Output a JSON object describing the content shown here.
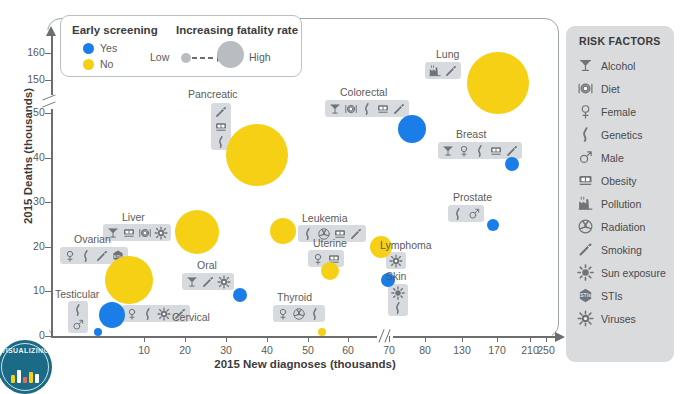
{
  "chart_data": {
    "type": "scatter",
    "title": "",
    "xlabel": "2015 New diagnoses (thousands)",
    "ylabel": "2015 Deaths (thousands)",
    "xticks": [
      10,
      20,
      30,
      40,
      50,
      60,
      70,
      80,
      130,
      170,
      210,
      250
    ],
    "yticks": [
      0,
      10,
      20,
      30,
      40,
      50,
      150,
      160
    ],
    "x_axis_break_after": 80,
    "y_axis_break_after": 50,
    "grid": false,
    "bubble_meaning": "bubble size = fatality rate (deaths / new diagnoses)",
    "color_meaning": "color = early screening available (blue = Yes, yellow = No)",
    "points": [
      {
        "label": "Lung",
        "x": 224,
        "y": 158,
        "early_screening": "Yes",
        "fatality": "High",
        "risk_factors": [
          "Pollution",
          "Smoking"
        ]
      },
      {
        "label": "Colorectal",
        "x": 134,
        "y": 49,
        "early_screening": "Yes",
        "fatality": "Medium",
        "risk_factors": [
          "Alcohol",
          "Diet",
          "Genetics",
          "Obesity",
          "Smoking"
        ]
      },
      {
        "label": "Breast",
        "x": 232,
        "y": 41,
        "early_screening": "Yes",
        "fatality": "Low",
        "risk_factors": [
          "Alcohol",
          "Female",
          "Genetics",
          "Obesity",
          "Smoking"
        ]
      },
      {
        "label": "Pancreatic",
        "x": 49,
        "y": 41,
        "early_screening": "No",
        "fatality": "High",
        "risk_factors": [
          "Smoking",
          "Obesity",
          "Genetics"
        ]
      },
      {
        "label": "Liver",
        "x": 36,
        "y": 26,
        "early_screening": "No",
        "fatality": "High",
        "risk_factors": [
          "Alcohol",
          "Obesity",
          "Diet",
          "Viruses"
        ]
      },
      {
        "label": "Leukemia",
        "x": 54,
        "y": 24,
        "early_screening": "No",
        "fatality": "Medium",
        "risk_factors": [
          "Genetics",
          "Radiation",
          "Obesity",
          "Smoking"
        ]
      },
      {
        "label": "Ovarian",
        "x": 22,
        "y": 14,
        "early_screening": "No",
        "fatality": "High",
        "risk_factors": [
          "Female",
          "Genetics",
          "Smoking",
          "STIs"
        ]
      },
      {
        "label": "Lymphoma",
        "x": 72,
        "y": 20,
        "early_screening": "No",
        "fatality": "Medium",
        "risk_factors": [
          "Viruses"
        ]
      },
      {
        "label": "Uterine",
        "x": 55,
        "y": 11,
        "early_screening": "No",
        "fatality": "Low",
        "risk_factors": [
          "Female",
          "Obesity"
        ]
      },
      {
        "label": "Prostate",
        "x": 220,
        "y": 27,
        "early_screening": "Yes",
        "fatality": "Low",
        "risk_factors": [
          "Genetics",
          "Male"
        ]
      },
      {
        "label": "Skin",
        "x": 76,
        "y": 13,
        "early_screening": "Yes",
        "fatality": "Low",
        "risk_factors": [
          "Sun exposure",
          "Genetics"
        ]
      },
      {
        "label": "Oral",
        "x": 45,
        "y": 10,
        "early_screening": "Yes",
        "fatality": "Low",
        "risk_factors": [
          "Alcohol",
          "Smoking",
          "Viruses"
        ]
      },
      {
        "label": "Cervical",
        "x": 13,
        "y": 4,
        "early_screening": "Yes",
        "fatality": "Medium",
        "risk_factors": [
          "Female",
          "Genetics",
          "Viruses",
          "Smoking"
        ]
      },
      {
        "label": "Testicular",
        "x": 9,
        "y": 0.4,
        "early_screening": "Yes",
        "fatality": "Low",
        "risk_factors": [
          "Genetics",
          "Male"
        ]
      },
      {
        "label": "Thyroid",
        "x": 62,
        "y": 2,
        "early_screening": "No",
        "fatality": "Low",
        "risk_factors": [
          "Female",
          "Radiation",
          "Genetics"
        ]
      }
    ]
  },
  "legend": {
    "screening_title": "Early screening",
    "screening_items": [
      {
        "label": "Yes",
        "color": "#1a7de8"
      },
      {
        "label": "No",
        "color": "#f5d014"
      }
    ],
    "size_title": "Increasing fatality rate",
    "size_low_label": "Low",
    "size_high_label": "High"
  },
  "risk_panel": {
    "title": "RISK FACTORS",
    "items": [
      {
        "label": "Alcohol",
        "icon": "martini-glass-icon"
      },
      {
        "label": "Diet",
        "icon": "plate-cutlery-icon"
      },
      {
        "label": "Female",
        "icon": "venus-symbol-icon"
      },
      {
        "label": "Genetics",
        "icon": "dna-helix-icon"
      },
      {
        "label": "Male",
        "icon": "mars-symbol-icon"
      },
      {
        "label": "Obesity",
        "icon": "weight-scale-icon"
      },
      {
        "label": "Pollution",
        "icon": "factory-icon"
      },
      {
        "label": "Radiation",
        "icon": "radiation-icon"
      },
      {
        "label": "Smoking",
        "icon": "cigarette-icon"
      },
      {
        "label": "Sun exposure",
        "icon": "sun-icon"
      },
      {
        "label": "STIs",
        "icon": "sti-hexagon-icon"
      },
      {
        "label": "Viruses",
        "icon": "virus-icon"
      }
    ]
  },
  "branding": {
    "logo_text": "VISUALIZING",
    "caption": ""
  },
  "colors": {
    "blue": "#1a7de8",
    "yellow": "#f5d014",
    "chip_bg": "#d7dade",
    "panel_bg": "#d9dbdd",
    "axis": "#6d6d6d",
    "frame": "#9aa4ad"
  }
}
